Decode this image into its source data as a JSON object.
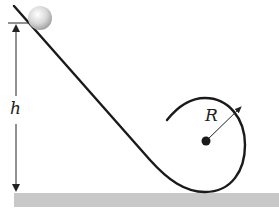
{
  "diagram": {
    "labels": {
      "height": "h",
      "radius": "R"
    },
    "elements": {
      "ball": "sphere at top of incline",
      "track": "inclined straight track curving into circular loop",
      "loop_center": "center point of loop",
      "ground": "horizontal ground surface"
    },
    "colors": {
      "track": "#1a1a1a",
      "ground": "#c8c8c8",
      "ball_highlight": "#ffffff",
      "ball_shadow": "#9a9a9a",
      "text": "#222222"
    }
  }
}
